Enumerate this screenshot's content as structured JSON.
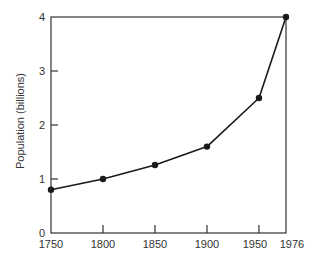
{
  "chart_data": {
    "type": "line",
    "title": "",
    "xlabel": "",
    "ylabel": "Population (billions)",
    "x": [
      1750,
      1800,
      1850,
      1900,
      1950,
      1976
    ],
    "series": [
      {
        "name": "World population",
        "values": [
          0.8,
          1.0,
          1.26,
          1.6,
          2.5,
          4.0
        ]
      }
    ],
    "xlim": [
      1750,
      1976
    ],
    "ylim": [
      0,
      4
    ],
    "x_ticks": [
      1750,
      1800,
      1850,
      1900,
      1950,
      1976
    ],
    "x_tick_labels": [
      "1750",
      "1800",
      "1850",
      "1900",
      "1950",
      "1976"
    ],
    "y_ticks": [
      0,
      1,
      2,
      3,
      4
    ],
    "y_tick_labels": [
      "0",
      "1",
      "2",
      "3",
      "4"
    ],
    "grid": false,
    "legend": null,
    "frame": "box",
    "markers": "filled-circle"
  },
  "colors": {
    "line": "#1a1a1a",
    "axis": "#333333",
    "background": "#ffffff"
  }
}
